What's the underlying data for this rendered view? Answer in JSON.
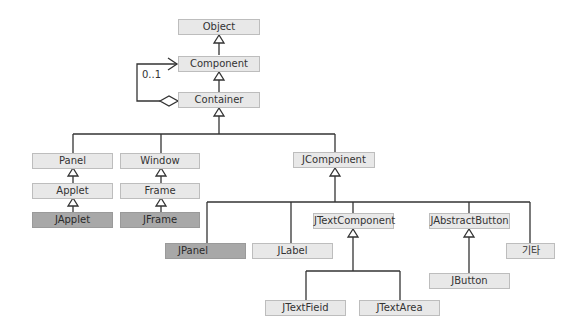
{
  "diagram": {
    "classes": {
      "object": "Object",
      "component": "Component",
      "container": "Container",
      "panel": "Panel",
      "window": "Window",
      "applet": "Applet",
      "frame": "Frame",
      "japplet": "JApplet",
      "jframe": "JFrame",
      "jcomponent": "JCompoinent",
      "jpanel": "JPanel",
      "jlabel": "JLabel",
      "jtextcomponent": "JTextComponent",
      "jabstractbutton": "JAbstractButton",
      "etc": "기타",
      "jbutton": "JButton",
      "jtextfield": "JTextFieid",
      "jtextarea": "JTextArea"
    },
    "multiplicity": "0..1",
    "colors": {
      "box_fill": "#e8e8e8",
      "box_dark_fill": "#a8a8a8",
      "line": "#333333"
    }
  }
}
